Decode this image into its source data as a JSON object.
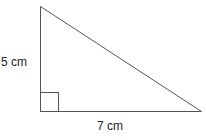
{
  "diagram": {
    "type": "right-triangle",
    "labels": {
      "height": "5 cm",
      "base": "7 cm"
    },
    "right_angle_marker": true,
    "colors": {
      "stroke": "#555555",
      "text": "#222222",
      "background": "#ffffff"
    }
  }
}
